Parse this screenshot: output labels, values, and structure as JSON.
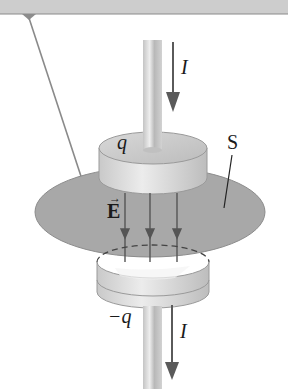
{
  "diagram": {
    "type": "physics-figure",
    "labels": {
      "current_top": "I",
      "current_bottom": "I",
      "charge_top": "q",
      "charge_bottom": "−q",
      "surface": "S",
      "field": "E",
      "field_arrow": "→"
    },
    "colors": {
      "background": "#ffffff",
      "top_bar": "#c8c8c8",
      "surface_fill": "#a9a9a9",
      "plate_light": "#e8e8e8",
      "plate_dark": "#b5b5b5",
      "wire": "#cfcfcf",
      "arrow": "#5a5a5a",
      "lines": "#555555"
    }
  }
}
